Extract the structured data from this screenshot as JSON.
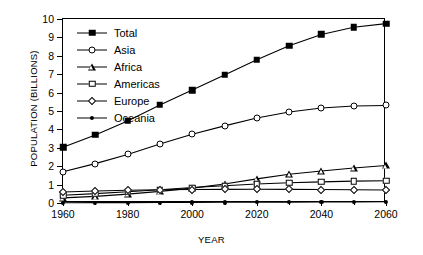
{
  "chart_data": {
    "type": "line",
    "title": "",
    "xlabel": "YEAR",
    "ylabel": "POPULATION (BILLIONS)",
    "xlim": [
      1960,
      2060
    ],
    "ylim": [
      0,
      10
    ],
    "grid": false,
    "legend_position": "top-left",
    "x": [
      1960,
      1970,
      1980,
      1990,
      2000,
      2010,
      2020,
      2030,
      2040,
      2050,
      2060
    ],
    "xticks_major": [
      1960,
      1980,
      2000,
      2020,
      2040,
      2060
    ],
    "xticks_minor": [
      1970,
      1990,
      2010,
      2030,
      2050
    ],
    "yticks": [
      0,
      1,
      2,
      3,
      4,
      5,
      6,
      7,
      8,
      9,
      10
    ],
    "series": [
      {
        "name": "Total",
        "marker": "filled-square",
        "values": [
          3.03,
          3.7,
          4.46,
          5.33,
          6.14,
          6.96,
          7.79,
          8.55,
          9.16,
          9.55,
          9.75
        ]
      },
      {
        "name": "Asia",
        "marker": "open-circle",
        "values": [
          1.7,
          2.14,
          2.64,
          3.21,
          3.74,
          4.19,
          4.62,
          4.95,
          5.16,
          5.27,
          5.3
        ]
      },
      {
        "name": "Africa",
        "marker": "open-triangle",
        "values": [
          0.28,
          0.36,
          0.48,
          0.63,
          0.81,
          1.03,
          1.31,
          1.56,
          1.74,
          1.9,
          2.04
        ]
      },
      {
        "name": "Americas",
        "marker": "open-square",
        "values": [
          0.42,
          0.51,
          0.61,
          0.72,
          0.84,
          0.94,
          1.03,
          1.1,
          1.15,
          1.19,
          1.21
        ]
      },
      {
        "name": "Europe",
        "marker": "open-diamond",
        "values": [
          0.6,
          0.65,
          0.69,
          0.72,
          0.73,
          0.74,
          0.75,
          0.74,
          0.73,
          0.72,
          0.71
        ]
      },
      {
        "name": "Oceania",
        "marker": "filled-circle",
        "values": [
          0.016,
          0.02,
          0.023,
          0.027,
          0.031,
          0.037,
          0.043,
          0.049,
          0.055,
          0.06,
          0.065
        ]
      }
    ]
  }
}
